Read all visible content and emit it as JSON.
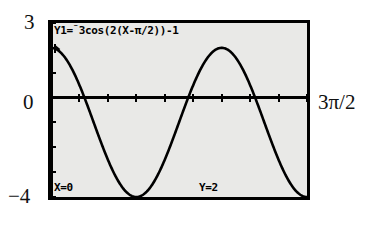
{
  "figure": {
    "kind": "graphing-calculator-screenshot"
  },
  "annotations": {
    "y_max_label": "3",
    "y_zero_label": "0",
    "y_min_label": "−4",
    "x_max_label": "3π/2"
  },
  "calculator": {
    "equation": {
      "prefix": "Y1=",
      "negation": "⁻",
      "body": "3cos(2(X-π/2))-1",
      "full": "Y1=⁻3cos(2(X-π/2))-1"
    },
    "status": {
      "x_readout": "X=0",
      "y_readout": "Y=2"
    },
    "cursor": {
      "name": "trace-cursor",
      "x": 0,
      "y": 2
    },
    "colors": {
      "screen_background": "#e9e9e7",
      "ink": "#000000",
      "bezel": "#000000",
      "page_background": "#ffffff"
    }
  },
  "chart_data": {
    "type": "line",
    "title": "",
    "subtitle": "",
    "xlabel": "",
    "ylabel": "",
    "equation": "y = -3cos(2(x - π/2)) - 1",
    "grid": false,
    "legend_position": "none",
    "xlim": [
      0,
      4.71238898
    ],
    "ylim": [
      -4,
      3
    ],
    "x_tick_labels": [],
    "y_tick_labels": [
      "3",
      "0",
      "−4"
    ],
    "x_tick_step": 0.5235987756,
    "y_tick_step": 1,
    "axis_x_at_y": 0,
    "axis_y_at_x": 0,
    "amplitude": 3,
    "vertical_shift": -1,
    "period": 3.14159265,
    "phase_shift": 1.57079633,
    "series": [
      {
        "name": "Y1",
        "x": [
          0.0,
          0.1178,
          0.2356,
          0.3534,
          0.4712,
          0.589,
          0.7069,
          0.8247,
          0.9425,
          1.0603,
          1.1781,
          1.2959,
          1.4137,
          1.5315,
          1.6493,
          1.7671,
          1.885,
          2.0028,
          2.1206,
          2.2384,
          2.3562,
          2.474,
          2.5918,
          2.7096,
          2.8274,
          2.9452,
          3.0631,
          3.1809,
          3.2987,
          3.4165,
          3.5343,
          3.6521,
          3.7699,
          3.8877,
          4.0055,
          4.1233,
          4.2412,
          4.359,
          4.4768,
          4.5946,
          4.7124
        ],
        "y": [
          2.0,
          1.866,
          1.4775,
          0.882,
          0.1459,
          -0.6541,
          -1.4387,
          -2.1317,
          -2.666,
          -2.9889,
          -3.0704,
          -2.9065,
          -2.5195,
          -1.9534,
          -1.2678,
          -0.5302,
          0.1924,
          0.8366,
          1.3463,
          1.6773,
          1.8,
          1.7027,
          1.3924,
          0.8942,
          0.2503,
          -0.4817,
          -1.2401,
          -1.9616,
          -2.5862,
          -3.0614,
          -3.3447,
          -3.4063,
          -3.2313,
          -2.8206,
          -2.1915,
          -1.3766,
          -0.4222,
          0.6143,
          1.6699,
          2.6806,
          3.5858
        ]
      }
    ],
    "key_points": [
      {
        "label": "start / trace cursor",
        "x": 0,
        "y": 2
      },
      {
        "label": "minimum",
        "x": 1.5708,
        "y": -4
      },
      {
        "label": "maximum",
        "x": 3.1416,
        "y": 2
      },
      {
        "label": "minimum",
        "x": 4.7124,
        "y": -4
      }
    ]
  }
}
